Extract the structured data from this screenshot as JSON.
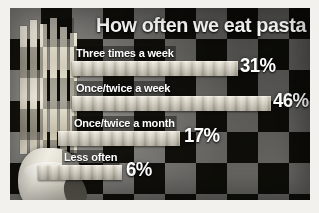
{
  "graphic": {
    "title": "How often we eat pasta",
    "frame_color": "#f2f1ee",
    "cloth_dark": "#15140f",
    "cloth_light": "#7b7a76",
    "text_color": "#ffffff",
    "pasta_color": "#efeade",
    "photo_caption": "hand-holding-spaghetti"
  },
  "chart_data": {
    "type": "bar",
    "orientation": "horizontal",
    "title": "How often we eat pasta",
    "xlabel": "",
    "ylabel": "",
    "xlim": [
      0,
      50
    ],
    "grid": false,
    "legend": "none",
    "categories": [
      "Three times a week",
      "Once/twice a week",
      "Once/twice a month",
      "Less often"
    ],
    "values": [
      31,
      46,
      17,
      6
    ],
    "value_labels": [
      "31%",
      "46%",
      "17%",
      "6%"
    ],
    "units": "percent"
  },
  "rows": [
    {
      "label": "Three times a week",
      "value_label": "31%",
      "bar_px": 166,
      "bar_left_px": 62,
      "value_left_px": 230
    },
    {
      "label": "Once/twice a week",
      "value_label": "46%",
      "bar_px": 199,
      "bar_left_px": 62,
      "value_left_px": 263
    },
    {
      "label": "Once/twice a month",
      "value_label": "17%",
      "bar_px": 122,
      "bar_left_px": 48,
      "value_left_px": 174
    },
    {
      "label": "Less often",
      "value_label": "6%",
      "bar_px": 84,
      "bar_left_px": 28,
      "value_left_px": 116
    }
  ]
}
